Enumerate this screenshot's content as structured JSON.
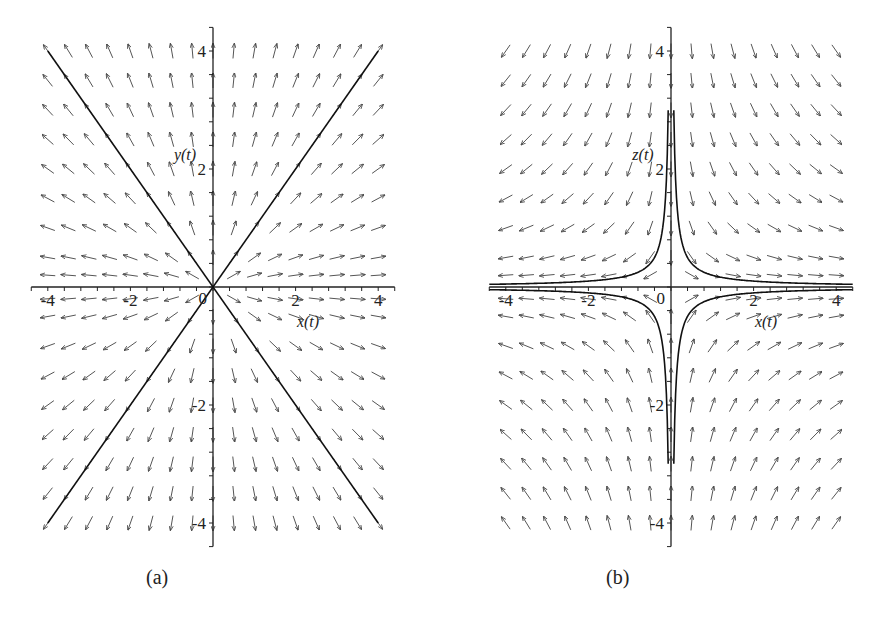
{
  "chart_data": [
    {
      "panel": "(a)",
      "type": "vector-field",
      "title": "",
      "xlabel": "x(t)",
      "ylabel": "y(t)",
      "xlim": [
        -4.2,
        4.2
      ],
      "ylim": [
        -4.2,
        4.2
      ],
      "xticks": [
        -4,
        -2,
        0,
        2,
        4
      ],
      "yticks": [
        -4,
        -2,
        2,
        4
      ],
      "field": {
        "dx": "x",
        "dy": "y"
      },
      "grid_points": {
        "x": [
          -4,
          -3.5,
          -3,
          -2.5,
          -2,
          -1.5,
          -1,
          -0.5,
          0,
          0.5,
          1,
          1.5,
          2,
          2.5,
          3,
          3.5,
          4
        ],
        "y_spacing": 0.5
      },
      "trajectories": [
        {
          "name": "line y = x",
          "points": [
            [
              -4,
              -4
            ],
            [
              4,
              4
            ]
          ]
        },
        {
          "name": "line y = -x",
          "points": [
            [
              -4,
              4
            ],
            [
              4,
              -4
            ]
          ]
        }
      ],
      "description": "Unstable star node at origin; arrows point radially outward"
    },
    {
      "panel": "(b)",
      "type": "vector-field",
      "title": "",
      "xlabel": "x(t)",
      "ylabel": "z(t)",
      "xlim": [
        -4.2,
        4.2
      ],
      "ylim": [
        -4.2,
        4.2
      ],
      "xticks": [
        -4,
        -2,
        0,
        2,
        4
      ],
      "yticks": [
        -4,
        -2,
        2,
        4
      ],
      "field": {
        "dx": "x",
        "dy": "-z"
      },
      "trajectories": [
        {
          "name": "x*z = 0.2 (quadrant I)",
          "curve": "z = 0.2/x",
          "x_range": [
            0.05,
            4.2
          ]
        },
        {
          "name": "x*z = -0.2 (quadrant II)",
          "curve": "z = -0.2/x",
          "x_range": [
            -4.2,
            -0.05
          ]
        },
        {
          "name": "x*z = -0.2 (quadrant IV)",
          "curve": "z = -0.2/x",
          "x_range": [
            0.05,
            4.2
          ]
        },
        {
          "name": "x*z = 0.2 (quadrant III)",
          "curve": "z = 0.2/x",
          "x_range": [
            -4.2,
            -0.05
          ]
        }
      ],
      "description": "Saddle point at origin; hyperbolic trajectories"
    }
  ],
  "captions": {
    "a": "(a)",
    "b": "(b)"
  },
  "axis_labels": {
    "a": {
      "x": "x(t)",
      "y": "y(t)",
      "origin": "0",
      "x_ticks": [
        "-4",
        "-2",
        "2",
        "4"
      ],
      "y_ticks": [
        "4",
        "2",
        "-2",
        "-4"
      ]
    },
    "b": {
      "x": "x(t)",
      "y": "z(t)",
      "origin": "0",
      "x_ticks": [
        "-4",
        "-2",
        "2",
        "4"
      ],
      "y_ticks": [
        "4",
        "2",
        "-2",
        "-4"
      ]
    }
  }
}
